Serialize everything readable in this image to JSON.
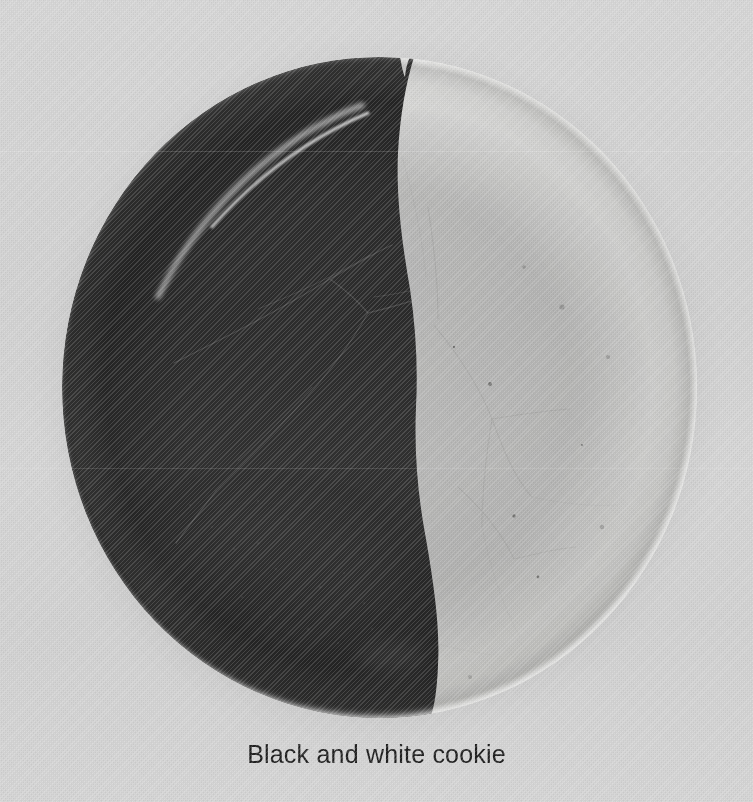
{
  "page": {
    "width": 753,
    "height": 802,
    "background_color": "#d6d6d6",
    "medium": "scanned printed photograph"
  },
  "photo": {
    "alt": "Black and white cookie",
    "subject": "black-and-white-cookie",
    "shape": "circle",
    "center_x": 379,
    "center_y": 387,
    "radius": 331,
    "halves": [
      {
        "name": "chocolate-half",
        "side": "left",
        "color": "#060606"
      },
      {
        "name": "vanilla-icing-half",
        "side": "right",
        "color": "#f7f7f5"
      }
    ],
    "divider": {
      "name": "icing-divide",
      "description": "vertical wavy line separating the chocolate and vanilla halves",
      "top_x": 399,
      "middle_x": 412,
      "bottom_x": 432
    },
    "highlights": {
      "upper_left_rim": "#ffffff",
      "lower_right_rim": "#ffffff",
      "contact_shadow": "#6e6e6e"
    }
  },
  "caption": {
    "text": "Black and white cookie",
    "color": "#1d1d1d",
    "font_size_px": 25,
    "align": "center",
    "top_px": 740
  }
}
